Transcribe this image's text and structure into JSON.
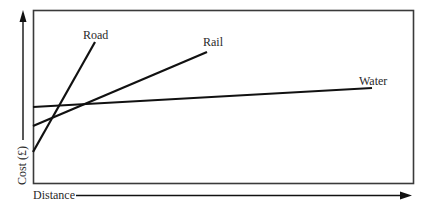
{
  "diagram": {
    "x_axis_label": "Distance",
    "y_axis_label": "Cost (£)",
    "series": [
      {
        "name": "Road",
        "label": "Road",
        "x1": 33,
        "y1": 152,
        "x2": 95,
        "y2": 42,
        "label_x": 83,
        "label_y": 39
      },
      {
        "name": "Rail",
        "label": "Rail",
        "x1": 33,
        "y1": 126,
        "x2": 207,
        "y2": 52,
        "label_x": 203,
        "label_y": 46
      },
      {
        "name": "Water",
        "label": "Water",
        "x1": 33,
        "y1": 107,
        "x2": 372,
        "y2": 88,
        "label_x": 359,
        "label_y": 85
      }
    ],
    "colors": {
      "line": "#111111",
      "frame": "#3a3a3a",
      "text": "#2a2a2a"
    }
  }
}
